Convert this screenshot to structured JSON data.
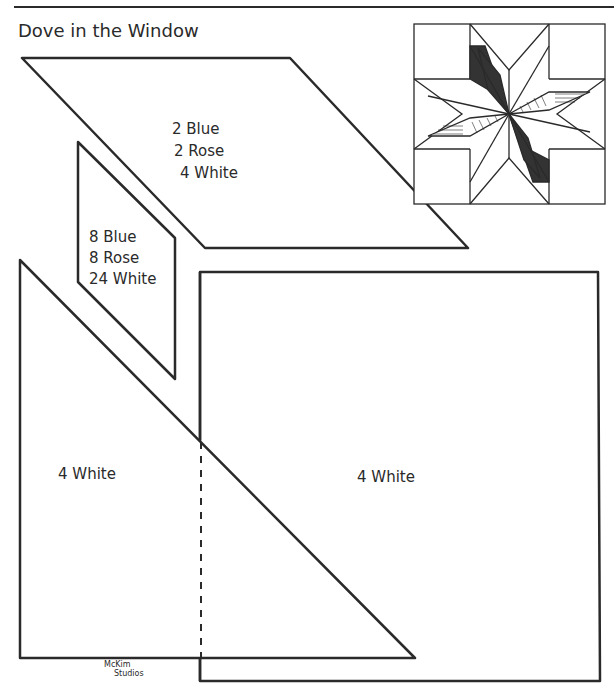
{
  "title": "Dove in the Window",
  "pattern_pieces": [
    {
      "shape": "diamond",
      "lines": [
        "2 Blue",
        "2 Rose",
        "4 White"
      ]
    },
    {
      "shape": "parallelogram",
      "lines": [
        "8 Blue",
        "8 Rose",
        "24 White"
      ]
    },
    {
      "shape": "triangle",
      "lines": [
        "4 White"
      ]
    },
    {
      "shape": "square",
      "lines": [
        "4 White"
      ]
    }
  ],
  "credit": {
    "line1": "McKim",
    "line2": "Studios"
  },
  "colors": {
    "ink": "#2a2a2a",
    "background": "#ffffff",
    "dark_fill": "#333333"
  },
  "block_illustration": "eight-pointed star quilt block"
}
